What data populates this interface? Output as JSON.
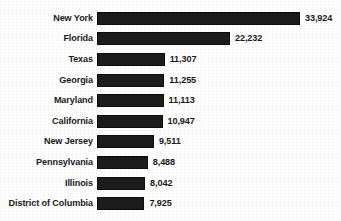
{
  "chart_data": {
    "type": "bar",
    "orientation": "horizontal",
    "title": "",
    "subtitle": "",
    "xlabel": "",
    "ylabel": "",
    "grid": false,
    "legend": "none",
    "axis_visible": false,
    "tick_labels": [],
    "xlim": [
      0,
      33924
    ],
    "bar_color": "#1c1c1c",
    "background_color": "#fdfdfd",
    "text_color": "#1b1b1b",
    "value_label_format": "comma-separated integer",
    "categories": [
      "New York",
      "Florida",
      "Texas",
      "Georgia",
      "Maryland",
      "California",
      "New Jersey",
      "Pennsylvania",
      "Illinois",
      "District of Columbia"
    ],
    "values": [
      33924,
      22232,
      11307,
      11255,
      11113,
      10947,
      9511,
      8488,
      8042,
      7925
    ],
    "value_labels": [
      "33,924",
      "22,232",
      "11,307",
      "11,255",
      "11,113",
      "10,947",
      "9,511",
      "8,488",
      "8,042",
      "7,925"
    ],
    "rows": [
      {
        "category": "New York",
        "value": 33924,
        "value_label": "33,924"
      },
      {
        "category": "Florida",
        "value": 22232,
        "value_label": "22,232"
      },
      {
        "category": "Texas",
        "value": 11307,
        "value_label": "11,307"
      },
      {
        "category": "Georgia",
        "value": 11255,
        "value_label": "11,255"
      },
      {
        "category": "Maryland",
        "value": 11113,
        "value_label": "11,113"
      },
      {
        "category": "California",
        "value": 10947,
        "value_label": "10,947"
      },
      {
        "category": "New Jersey",
        "value": 9511,
        "value_label": "9,511"
      },
      {
        "category": "Pennsylvania",
        "value": 8488,
        "value_label": "8,488"
      },
      {
        "category": "Illinois",
        "value": 8042,
        "value_label": "8,042"
      },
      {
        "category": "District of Columbia",
        "value": 7925,
        "value_label": "7,925"
      }
    ]
  }
}
